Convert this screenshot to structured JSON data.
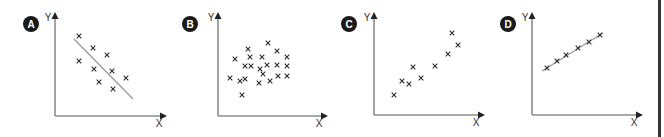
{
  "chart_data": [
    {
      "type": "scatter",
      "id": "A",
      "title": "A",
      "xlabel": "X",
      "ylabel": "Y",
      "description": "Negative correlation with line of best fit",
      "trend_line": true,
      "axes_px": {
        "origin": [
          55,
          116
        ],
        "x_end": 167,
        "y_top": 12
      },
      "badge_px": [
        31,
        24
      ],
      "xlabel_px": [
        159,
        127
      ],
      "ylabel_px": [
        48,
        21
      ],
      "line_px": [
        [
          74,
          39
        ],
        [
          133,
          99
        ]
      ],
      "points_px": [
        [
          79,
          36
        ],
        [
          93,
          48
        ],
        [
          107,
          55
        ],
        [
          79,
          61
        ],
        [
          94,
          69
        ],
        [
          112,
          71
        ],
        [
          126,
          78
        ],
        [
          99,
          82
        ],
        [
          113,
          89
        ]
      ]
    },
    {
      "type": "scatter",
      "id": "B",
      "title": "B",
      "xlabel": "X",
      "ylabel": "Y",
      "description": "No correlation",
      "trend_line": false,
      "axes_px": {
        "origin": [
          218,
          116
        ],
        "x_end": 328,
        "y_top": 12
      },
      "badge_px": [
        190,
        24
      ],
      "xlabel_px": [
        319,
        127
      ],
      "ylabel_px": [
        211,
        21
      ],
      "line_px": null,
      "points_px": [
        [
          268,
          43
        ],
        [
          248,
          49
        ],
        [
          277,
          51
        ],
        [
          235,
          59
        ],
        [
          250,
          57
        ],
        [
          262,
          57
        ],
        [
          287,
          57
        ],
        [
          245,
          66
        ],
        [
          251,
          66
        ],
        [
          260,
          69
        ],
        [
          267,
          65
        ],
        [
          277,
          65
        ],
        [
          287,
          66
        ],
        [
          230,
          78
        ],
        [
          240,
          81
        ],
        [
          245,
          79
        ],
        [
          263,
          74
        ],
        [
          259,
          83
        ],
        [
          270,
          81
        ],
        [
          278,
          76
        ],
        [
          287,
          76
        ],
        [
          242,
          95
        ]
      ]
    },
    {
      "type": "scatter",
      "id": "C",
      "title": "C",
      "xlabel": "X",
      "ylabel": "Y",
      "description": "Positive correlation (moderate)",
      "trend_line": false,
      "axes_px": {
        "origin": [
          374,
          115
        ],
        "x_end": 485,
        "y_top": 12
      },
      "badge_px": [
        349,
        24
      ],
      "xlabel_px": [
        476,
        126
      ],
      "ylabel_px": [
        367,
        21
      ],
      "line_px": null,
      "points_px": [
        [
          452,
          33
        ],
        [
          458,
          45
        ],
        [
          448,
          54
        ],
        [
          435,
          66
        ],
        [
          413,
          67
        ],
        [
          421,
          78
        ],
        [
          402,
          81
        ],
        [
          409,
          84
        ],
        [
          394,
          95
        ]
      ]
    },
    {
      "type": "scatter",
      "id": "D",
      "title": "D",
      "xlabel": "X",
      "ylabel": "Y",
      "description": "Strong positive correlation with line of best fit",
      "trend_line": true,
      "axes_px": {
        "origin": [
          532,
          115
        ],
        "x_end": 643,
        "y_top": 12
      },
      "badge_px": [
        508,
        24
      ],
      "xlabel_px": [
        634,
        126
      ],
      "ylabel_px": [
        525,
        21
      ],
      "line_px": [
        [
          542,
          71
        ],
        [
          603,
          33
        ]
      ],
      "points_px": [
        [
          547,
          68
        ],
        [
          557,
          61
        ],
        [
          566,
          55
        ],
        [
          578,
          48
        ],
        [
          589,
          42
        ],
        [
          600,
          35
        ]
      ]
    }
  ],
  "colors": {
    "badge": "#1a1a1a",
    "axis": "#8c8c8c",
    "point": "#2d2d2d",
    "trend_line": "#9a9a9a",
    "right_border": "#333333"
  }
}
